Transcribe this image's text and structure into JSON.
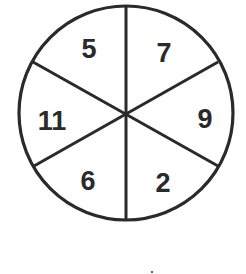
{
  "diagram": {
    "type": "circle-divided-into-sectors",
    "sector_count": 6,
    "stroke_color": "#2a2a2a",
    "background": "#ffffff",
    "sectors": [
      {
        "position": "top-left",
        "value": "5"
      },
      {
        "position": "top-right",
        "value": "7"
      },
      {
        "position": "right",
        "value": "9"
      },
      {
        "position": "bottom-right",
        "value": "2"
      },
      {
        "position": "bottom-left",
        "value": "6"
      },
      {
        "position": "left",
        "value": "11"
      }
    ]
  }
}
